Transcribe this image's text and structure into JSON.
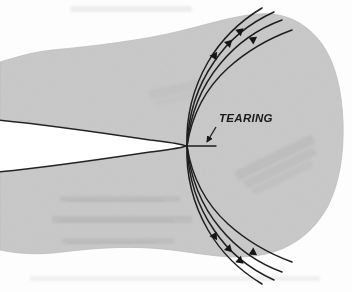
{
  "figure": {
    "domain": "Diagram",
    "kind": "fracture-mechanics-schematic",
    "title_label": "TEARING",
    "background_color": "#fdfdfd",
    "specimen_fill": "#c8c8c8",
    "specimen_edge_color": "#b4b4b4",
    "line_color": "#1a1a1a",
    "notch_fill": "#ffffff",
    "scan_noise": true
  },
  "annotations": {
    "tearing": {
      "label": "TEARING",
      "x": 218,
      "y": 122,
      "arrow_from_x": 215,
      "arrow_from_y": 126,
      "arrow_to_x": 207,
      "arrow_to_y": 142
    }
  },
  "geometry": {
    "crack_tip_x": 187,
    "crack_tip_y": 146,
    "tear_line_x1": 187,
    "tear_line_y1": 146,
    "tear_line_x2": 216,
    "tear_line_y2": 146,
    "notch_mouth_top_y": 122,
    "notch_mouth_bottom_y": 170,
    "notch_left_x": 0
  },
  "slip_lines": {
    "count_upper": 4,
    "count_lower": 4,
    "direction_upper": "up-right",
    "direction_lower": "down-right",
    "arrowheads_per_line": 1,
    "description": "plastic shear bands radiating from the crack tip"
  },
  "ghost_marks": [
    {
      "x": 60,
      "y": 196,
      "width": 120,
      "height": 7
    },
    {
      "x": 52,
      "y": 216,
      "width": 140,
      "height": 8
    },
    {
      "x": 62,
      "y": 238,
      "width": 112,
      "height": 7
    },
    {
      "x": 236,
      "y": 150,
      "width": 86,
      "height": 34
    },
    {
      "x": 150,
      "y": 82,
      "width": 60,
      "height": 26
    },
    {
      "x": 70,
      "y": 8,
      "width": 120,
      "height": 8
    }
  ]
}
